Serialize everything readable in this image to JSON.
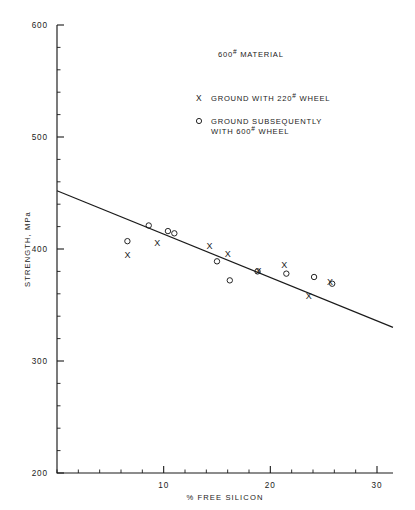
{
  "chart_data": {
    "type": "scatter",
    "title": "",
    "xlabel": "% FREE SILICON",
    "ylabel": "STRENGTH, MPa",
    "xlim": [
      0,
      31.5
    ],
    "ylim": [
      200,
      600
    ],
    "xticks": [
      10,
      20,
      30
    ],
    "yticks": [
      200,
      300,
      400,
      500,
      600
    ],
    "xtick_labels": [
      "10",
      "20",
      "30"
    ],
    "ytick_labels": [
      "200",
      "300",
      "400",
      "500",
      "600"
    ],
    "x_minor_step": 2,
    "y_minor_step": 20,
    "grid": false,
    "legend_position": "upper right",
    "annotations": [
      {
        "text": "600# MATERIAL",
        "base": "600",
        "sup": "#",
        "tail": " MATERIAL"
      }
    ],
    "series": [
      {
        "name": "GROUND WITH 220# WHEEL",
        "marker": "x",
        "points": [
          {
            "x": 6.6,
            "y": 395
          },
          {
            "x": 9.4,
            "y": 406
          },
          {
            "x": 14.3,
            "y": 403
          },
          {
            "x": 16.0,
            "y": 396
          },
          {
            "x": 18.9,
            "y": 381
          },
          {
            "x": 21.3,
            "y": 386
          },
          {
            "x": 23.6,
            "y": 358
          },
          {
            "x": 25.6,
            "y": 371
          }
        ]
      },
      {
        "name": "GROUND SUBSEQUENTLY WITH 600# WHEEL",
        "marker": "o",
        "points": [
          {
            "x": 6.6,
            "y": 407
          },
          {
            "x": 8.6,
            "y": 421
          },
          {
            "x": 10.4,
            "y": 416
          },
          {
            "x": 11.0,
            "y": 414
          },
          {
            "x": 15.0,
            "y": 389
          },
          {
            "x": 16.2,
            "y": 372
          },
          {
            "x": 18.8,
            "y": 380
          },
          {
            "x": 21.5,
            "y": 378
          },
          {
            "x": 24.1,
            "y": 375
          },
          {
            "x": 25.8,
            "y": 369
          }
        ]
      }
    ],
    "trend_line": {
      "name": "linear fit",
      "x_start": 0,
      "y_start": 452,
      "x_end": 31.5,
      "y_end": 330
    }
  },
  "legend": {
    "title": {
      "base": "600",
      "sup": "#",
      "tail": " MATERIAL"
    },
    "entries": [
      {
        "marker": "X",
        "line1_pre": "GROUND WITH 220",
        "line1_sup": "#",
        "line1_post": " WHEEL",
        "line2_pre": "",
        "line2_sup": "",
        "line2_post": ""
      },
      {
        "marker": "o",
        "line1_pre": "GROUND SUBSEQUENTLY",
        "line1_sup": "",
        "line1_post": "",
        "line2_pre": "WITH 600",
        "line2_sup": "#",
        "line2_post": " WHEEL"
      }
    ]
  }
}
